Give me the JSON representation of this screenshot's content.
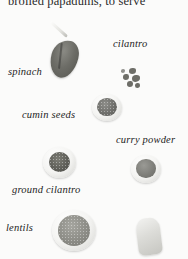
{
  "page": {
    "heading": "broiled papadums, to serve",
    "background_color": "#fbfbfa",
    "text_color": "#1d1d1d"
  },
  "ingredients": [
    {
      "label": "spinach",
      "icon": "spinach-leaf"
    },
    {
      "label": "cilantro",
      "icon": "cilantro-sprig"
    },
    {
      "label": "cumin seeds",
      "icon": "bowl-of-cumin-seeds"
    },
    {
      "label": "curry powder",
      "icon": "bowl-of-curry-powder"
    },
    {
      "label": "ground cilantro",
      "icon": "bowl-of-ground-cilantro"
    },
    {
      "label": "lentils",
      "icon": "bowl-of-lentils"
    }
  ],
  "unlabeled": {
    "icon": "pale-wedge-object"
  }
}
